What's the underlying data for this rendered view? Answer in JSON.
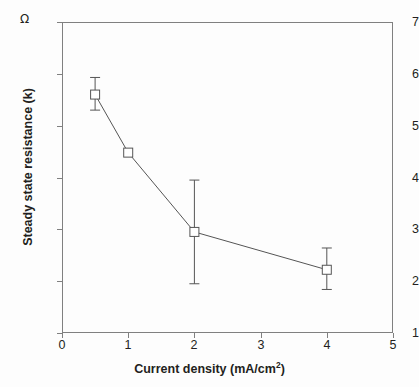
{
  "chart_data": {
    "type": "line",
    "title": "",
    "xlabel": "Current density (mA/cm",
    "xlabel_sup": "2",
    "xlabel_tail": ")",
    "xlabel_full": "Current density (mA/cm2)",
    "ylabel": "Steady state resistance (k",
    "ylabel_full": "Steady state resistance (k)",
    "yunit": "Ω",
    "x": [
      0.5,
      1.0,
      2.0,
      4.0
    ],
    "values": [
      5.6,
      4.48,
      2.95,
      2.22
    ],
    "yerr_upper": [
      0.33,
      0.0,
      1.0,
      0.42
    ],
    "yerr_lower": [
      0.3,
      0.0,
      1.0,
      0.38
    ],
    "xlim": [
      0,
      5
    ],
    "ylim": [
      1,
      7
    ],
    "xticks": [
      0,
      1,
      2,
      3,
      4,
      5
    ],
    "yticks": [
      1,
      2,
      3,
      4,
      5,
      6,
      7
    ],
    "xticklabels": [
      "0",
      "1",
      "2",
      "3",
      "4",
      "5"
    ],
    "yticklabels": [
      "1",
      "2",
      "3",
      "4",
      "5",
      "6",
      "7"
    ],
    "grid": false,
    "legend": false,
    "marker": "open-square",
    "marker_size": 9,
    "line_color": "#555555",
    "marker_edge_color": "#555555",
    "marker_face_color": "#ffffff",
    "axis_color": "#808080",
    "text_color": "#231f20"
  }
}
